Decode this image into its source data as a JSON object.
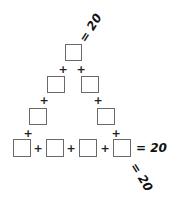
{
  "puzzle": {
    "description": "Triangle sum puzzle: fill boxes so each side sums to target",
    "target": "20",
    "equals_label": "= 20",
    "operator": "+",
    "sides": [
      "left-diagonal",
      "bottom-row",
      "right-diagonal"
    ],
    "box_count": 8
  }
}
